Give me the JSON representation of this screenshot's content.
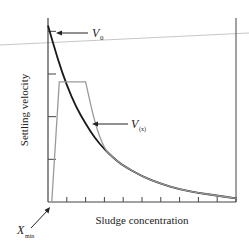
{
  "chart_data": {
    "type": "line",
    "title": "",
    "xlabel": "Sludge concentration",
    "ylabel": "Settling velocity",
    "xlim": [
      0,
      10
    ],
    "ylim": [
      0,
      1
    ],
    "x_ticks": 10,
    "y_ticks": 4,
    "series": [
      {
        "name": "settling velocity curve",
        "color": "#1a1a1a",
        "x": [
          0,
          0.5,
          1,
          1.5,
          2,
          2.5,
          3,
          3.5,
          4,
          5,
          6,
          7,
          8,
          9,
          10
        ],
        "y": [
          0.97,
          0.79,
          0.64,
          0.52,
          0.43,
          0.35,
          0.29,
          0.24,
          0.2,
          0.14,
          0.1,
          0.07,
          0.05,
          0.035,
          0.02
        ]
      },
      {
        "name": "limited velocity curve",
        "color": "#9a9a9a",
        "x": [
          0.2,
          0.6,
          1,
          1.5,
          2,
          2.5,
          3,
          3.5,
          4,
          5,
          6,
          7,
          8,
          9,
          10
        ],
        "y": [
          0,
          0.66,
          0.66,
          0.66,
          0.66,
          0.43,
          0.29,
          0.24,
          0.2,
          0.14,
          0.1,
          0.07,
          0.05,
          0.035,
          0.02
        ]
      }
    ],
    "annotations": [
      {
        "id": "v0",
        "text": "V",
        "sub": "0"
      },
      {
        "id": "vx",
        "text": "V",
        "sub": "(x)"
      },
      {
        "id": "xmin",
        "text": "X",
        "sub": "min"
      }
    ]
  }
}
